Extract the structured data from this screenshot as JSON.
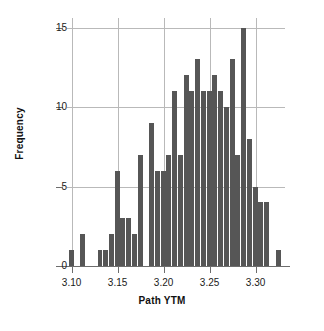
{
  "chart_data": {
    "type": "bar",
    "title": "",
    "subtitle": "",
    "xlabel": "Path YTM",
    "ylabel": "Frequency",
    "xlim": [
      3.095,
      3.332
    ],
    "ylim": [
      0,
      15.6
    ],
    "grid": true,
    "legend": null,
    "bin_width": 0.00625,
    "xticks": [
      "3.10",
      "3.15",
      "3.20",
      "3.25",
      "3.30"
    ],
    "xtick_values": [
      3.1,
      3.15,
      3.2,
      3.25,
      3.3
    ],
    "yticks": [
      "0",
      "5",
      "10",
      "15"
    ],
    "ytick_values": [
      0,
      5,
      10,
      15
    ],
    "bar_color": "#565656",
    "grid_color": "#b9b9b9",
    "axis_color": "#6d6d6d",
    "categories": [
      3.1,
      3.1125,
      3.1313,
      3.1375,
      3.1437,
      3.15,
      3.1562,
      3.1625,
      3.1687,
      3.175,
      3.1875,
      3.1937,
      3.2,
      3.2062,
      3.2125,
      3.2187,
      3.225,
      3.2312,
      3.2375,
      3.2437,
      3.25,
      3.2562,
      3.2625,
      3.2687,
      3.275,
      3.2812,
      3.2875,
      3.2937,
      3.3,
      3.3062,
      3.3125,
      3.325
    ],
    "values": [
      1,
      2,
      1,
      1,
      2,
      6,
      3,
      3,
      2,
      7,
      9,
      6,
      6,
      7,
      11,
      7,
      12,
      11,
      13,
      11,
      11,
      12,
      11,
      10,
      13,
      7,
      15,
      8,
      5,
      4,
      4,
      1
    ]
  },
  "axes": {
    "x_title": "Path YTM",
    "y_title": "Frequency"
  }
}
